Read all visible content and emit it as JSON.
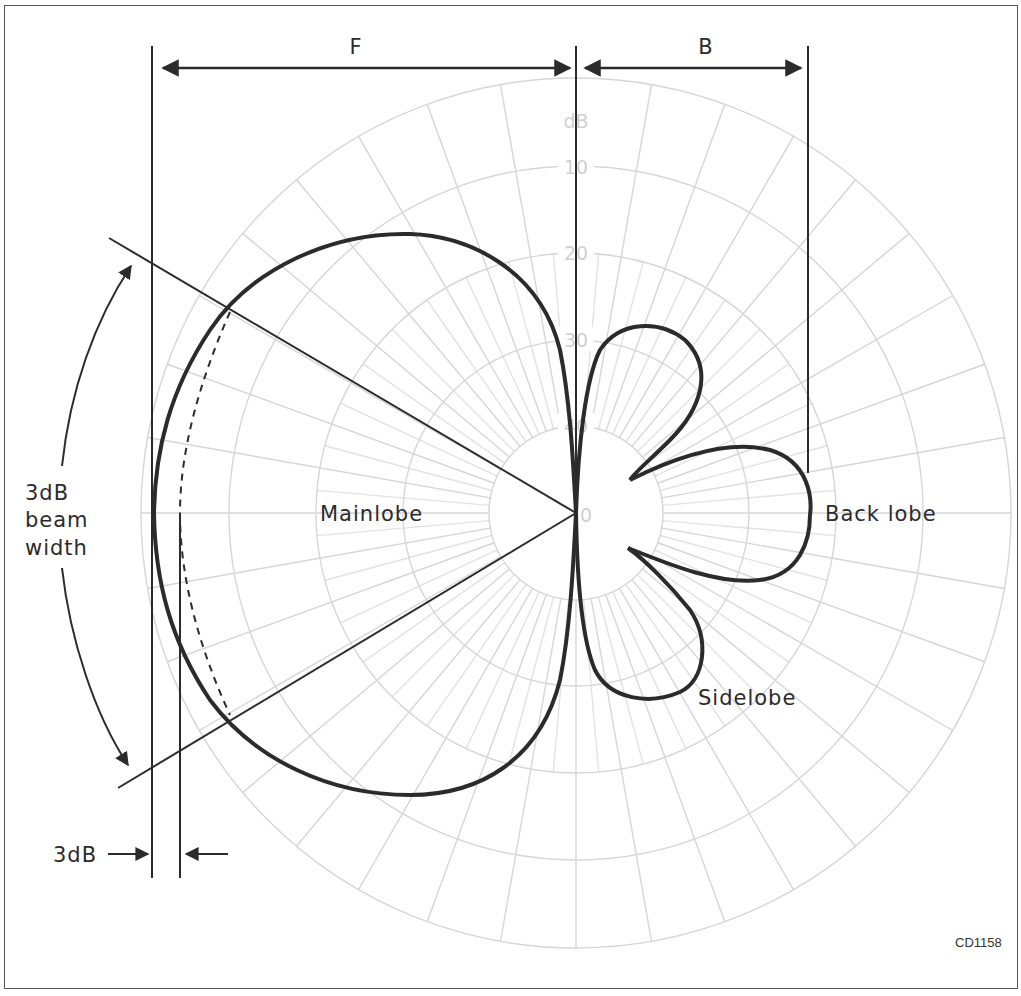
{
  "diagram": {
    "figure_code": "CD1158",
    "polar_grid": {
      "unit_label": "dB",
      "ring_labels": [
        "10",
        "20",
        "30",
        "40",
        "0"
      ],
      "spoke_interval_deg": 10
    },
    "dimension_labels": {
      "front": "F",
      "back": "B"
    },
    "annotations": {
      "main_lobe": "Mainlobe",
      "back_lobe": "Back lobe",
      "side_lobe": "Sidelobe",
      "beam_width_line1": "3dB",
      "beam_width_line2": "beam",
      "beam_width_line3": "width",
      "three_db_marker": "3dB"
    },
    "colors": {
      "ink": "#2b2b2b",
      "grid": "#d6d6d6",
      "grid_label": "#d0d0d0",
      "frame": "#555555",
      "background": "#ffffff"
    }
  }
}
